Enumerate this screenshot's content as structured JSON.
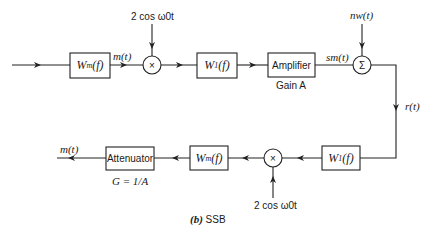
{
  "diagram": {
    "caption": "(b) SSB",
    "caption_label": "(b)",
    "caption_text": "SSB",
    "transmitter": {
      "input_filter": {
        "label": "Wm(f)",
        "main": "W",
        "sub": "m",
        "arg": "(f)"
      },
      "signal_after_filter": "m(t)",
      "mixer": {
        "symbol": "×",
        "lo_label": "2 cos ω0t"
      },
      "sideband_filter": {
        "label": "W1(f)",
        "main": "W",
        "sub": "1",
        "arg": "(f)"
      },
      "amplifier": {
        "label": "Amplifier",
        "gain_label": "Gain A"
      },
      "tx_signal": "sm(t)",
      "adder": {
        "symbol": "Σ",
        "noise_label": "nw(t)"
      },
      "channel_output": "r(t)"
    },
    "receiver": {
      "input_filter": {
        "label": "W1(f)",
        "main": "W",
        "sub": "1",
        "arg": "(f)"
      },
      "mixer": {
        "symbol": "×",
        "lo_label": "2 cos ω0t"
      },
      "lowpass_filter": {
        "label": "Wm(f)",
        "main": "W",
        "sub": "m",
        "arg": "(f)"
      },
      "attenuator": {
        "label": "Attenuator",
        "gain_label": "G = 1/A"
      },
      "output_signal": "m(t)"
    },
    "colors": {
      "line": "#222222",
      "background": "#ffffff"
    }
  }
}
